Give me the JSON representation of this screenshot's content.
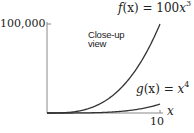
{
  "chart_data": {
    "type": "line",
    "title": "",
    "xlabel": "x",
    "ylabel": "",
    "xlim": [
      0,
      10
    ],
    "ylim": [
      0,
      100000
    ],
    "grid": false,
    "legend": "none (inline curve labels)",
    "x_ticks": [
      {
        "value": 10,
        "label": "10"
      }
    ],
    "y_ticks": [
      {
        "value": 100000,
        "label": "100,000"
      }
    ],
    "x": [
      0,
      1,
      2,
      3,
      4,
      5,
      6,
      7,
      8,
      9,
      10
    ],
    "series": [
      {
        "name": "f(x) = 100x^3",
        "label": "f(x) = 100x³",
        "values": [
          0,
          100,
          800,
          2700,
          6400,
          12500,
          21600,
          34300,
          51200,
          72900,
          100000
        ]
      },
      {
        "name": "g(x) = x^4",
        "label": "g(x) = x⁴",
        "values": [
          0,
          1,
          16,
          81,
          256,
          625,
          1296,
          2401,
          4096,
          6561,
          10000
        ]
      }
    ],
    "annotations": [
      "Close-up view"
    ]
  },
  "labels": {
    "y_tick": "100,000",
    "x_tick": "10",
    "x_axis": "x",
    "f_prefix": "f",
    "f_arg": "(x) = 100",
    "f_var": "x",
    "f_exp": "3",
    "g_prefix": "g",
    "g_arg": "(x) = ",
    "g_var": "x",
    "g_exp": "4",
    "annot_line1": "Close-up",
    "annot_line2": "view"
  },
  "colors": {
    "axis": "#777777",
    "curve": "#333333",
    "text": "#222222"
  }
}
